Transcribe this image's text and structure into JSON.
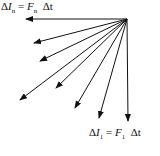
{
  "diagram": {
    "type": "vector fan",
    "origin": [
      127,
      19
    ],
    "arrows": [
      {
        "to": [
          26,
          19
        ]
      },
      {
        "to": [
          34,
          43
        ]
      },
      {
        "to": [
          40,
          61
        ]
      },
      {
        "to": [
          20,
          100
        ]
      },
      {
        "to": [
          56,
          88
        ]
      },
      {
        "to": [
          75,
          108
        ]
      },
      {
        "to": [
          99,
          118
        ]
      },
      {
        "to": [
          128,
          121
        ]
      }
    ],
    "color": "#111111"
  },
  "labels": {
    "top": {
      "delta": "Δ",
      "I": "I",
      "sub": "n",
      "eq": "=",
      "F": "F",
      "fsub": "n",
      "dt": "Δt"
    },
    "bottom": {
      "delta": "Δ",
      "I": "I",
      "sub": "1",
      "eq": "=",
      "F": "F",
      "fsub": "1",
      "dt": "Δt"
    }
  }
}
